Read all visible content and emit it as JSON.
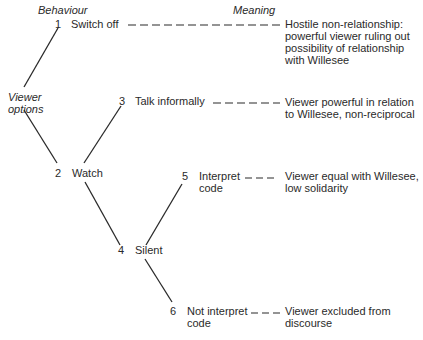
{
  "headers": {
    "behaviour": "Behaviour",
    "meaning": "Meaning",
    "viewer_options_1": "Viewer",
    "viewer_options_2": "options"
  },
  "nodes": [
    {
      "num": "1",
      "label_1": "Switch off",
      "label_2": ""
    },
    {
      "num": "2",
      "label_1": "Watch",
      "label_2": ""
    },
    {
      "num": "3",
      "label_1": "Talk informally",
      "label_2": ""
    },
    {
      "num": "4",
      "label_1": "Silent",
      "label_2": ""
    },
    {
      "num": "5",
      "label_1": "Interpret",
      "label_2": "code"
    },
    {
      "num": "6",
      "label_1": "Not interpret",
      "label_2": "code"
    }
  ],
  "meanings": [
    {
      "node": "1",
      "lines": [
        "Hostile non-relationship:",
        "powerful viewer ruling out",
        "possibility of relationship",
        "with Willesee"
      ]
    },
    {
      "node": "3",
      "lines": [
        "Viewer powerful in relation",
        "to Willesee, non-reciprocal"
      ]
    },
    {
      "node": "5",
      "lines": [
        "Viewer equal with Willesee,",
        "low solidarity"
      ]
    },
    {
      "node": "6",
      "lines": [
        "Viewer excluded from",
        "discourse"
      ]
    }
  ],
  "colors": {
    "line": "#2a2a2a",
    "text": "#2a2a2a",
    "background": "#ffffff"
  }
}
